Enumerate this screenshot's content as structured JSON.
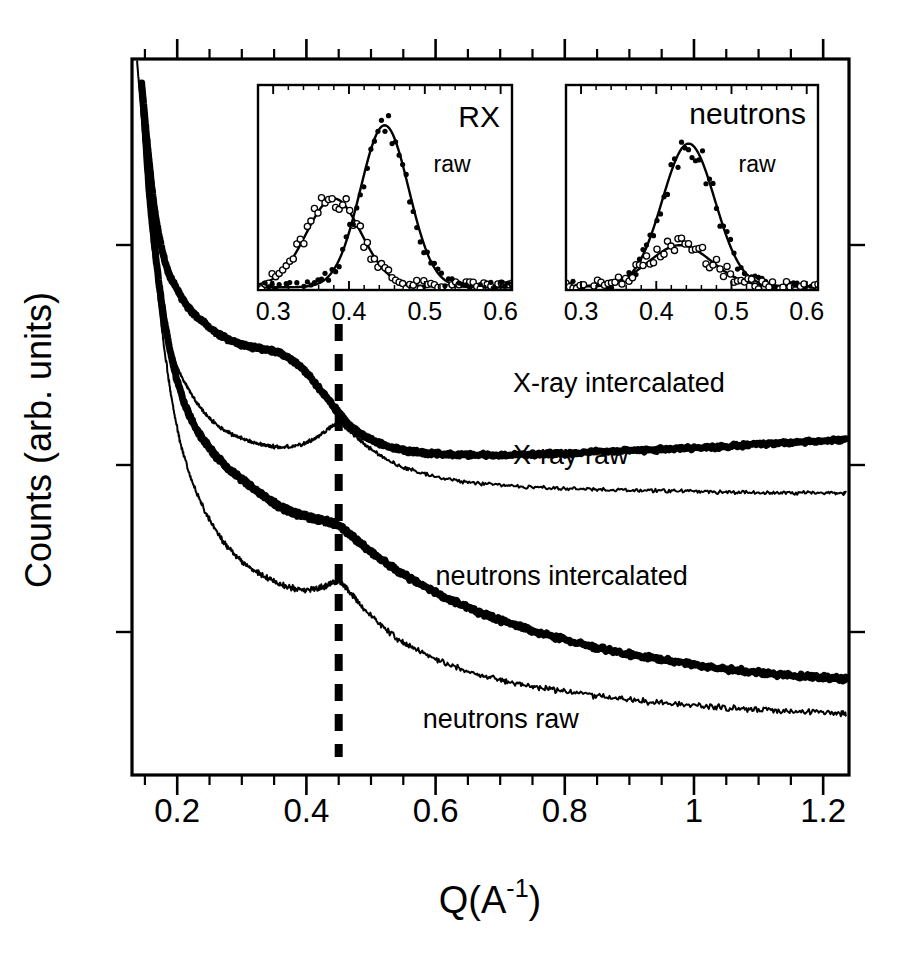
{
  "figure": {
    "caption_present": false,
    "background_color": "#ffffff",
    "ink_color": "#000000"
  },
  "chart_data": {
    "type": "line",
    "title": "",
    "xlabel": "Q(A-1)",
    "xlabel_base": "Q(A",
    "xlabel_sup": "-1",
    "xlabel_tail": ")",
    "ylabel": "Counts (arb. units)",
    "xlim": [
      0.13,
      1.24
    ],
    "ylim": [
      0,
      1
    ],
    "grid": false,
    "legend_position": "inline-annotations",
    "xticks": [
      0.2,
      0.4,
      0.6,
      0.8,
      1.0,
      1.2
    ],
    "xtick_labels": [
      "0.2",
      "0.4",
      "0.6",
      "0.8",
      "1",
      "1.2"
    ],
    "minor_ticks_per_interval": 3,
    "ytick_count": 3,
    "ytick_labels": [],
    "annotations": [
      {
        "name": "dashed-marker",
        "type": "vline",
        "x": 0.45,
        "style": "dashed",
        "linewidth": 7
      }
    ],
    "series": [
      {
        "name": "X-ray intercalated",
        "label": "X-ray intercalated",
        "style": "thick-solid",
        "linewidth": 7,
        "x": [
          0.145,
          0.155,
          0.165,
          0.175,
          0.185,
          0.195,
          0.21,
          0.225,
          0.24,
          0.26,
          0.28,
          0.3,
          0.32,
          0.34,
          0.36,
          0.38,
          0.4,
          0.42,
          0.44,
          0.45,
          0.47,
          0.49,
          0.52,
          0.55,
          0.58,
          0.62,
          0.66,
          0.7,
          0.75,
          0.8,
          0.85,
          0.9,
          0.95,
          1.0,
          1.05,
          1.1,
          1.15,
          1.2,
          1.235
        ],
        "y": [
          0.965,
          0.87,
          0.79,
          0.74,
          0.706,
          0.686,
          0.662,
          0.645,
          0.633,
          0.618,
          0.608,
          0.601,
          0.597,
          0.594,
          0.589,
          0.578,
          0.562,
          0.54,
          0.517,
          0.506,
          0.486,
          0.473,
          0.461,
          0.454,
          0.45,
          0.448,
          0.447,
          0.447,
          0.448,
          0.449,
          0.451,
          0.453,
          0.455,
          0.457,
          0.459,
          0.462,
          0.464,
          0.467,
          0.469
        ]
      },
      {
        "name": "X-ray raw",
        "label": "X-ray raw",
        "style": "thin-solid",
        "linewidth": 2,
        "x": [
          0.138,
          0.145,
          0.152,
          0.16,
          0.17,
          0.18,
          0.192,
          0.205,
          0.22,
          0.24,
          0.26,
          0.28,
          0.3,
          0.32,
          0.34,
          0.36,
          0.38,
          0.4,
          0.42,
          0.44,
          0.45,
          0.46,
          0.48,
          0.5,
          0.53,
          0.56,
          0.6,
          0.65,
          0.7,
          0.75,
          0.8,
          0.85,
          0.9,
          0.95,
          1.0,
          1.05,
          1.1,
          1.15,
          1.2,
          1.235
        ],
        "y": [
          0.995,
          0.92,
          0.84,
          0.76,
          0.69,
          0.636,
          0.592,
          0.56,
          0.535,
          0.508,
          0.49,
          0.478,
          0.47,
          0.464,
          0.46,
          0.458,
          0.459,
          0.464,
          0.474,
          0.487,
          0.492,
          0.486,
          0.47,
          0.455,
          0.438,
          0.427,
          0.417,
          0.409,
          0.405,
          0.402,
          0.4,
          0.399,
          0.398,
          0.397,
          0.396,
          0.395,
          0.394,
          0.394,
          0.394,
          0.394
        ]
      },
      {
        "name": "neutrons intercalated",
        "label": "neutrons intercalated",
        "style": "thick-solid",
        "linewidth": 7,
        "x": [
          0.148,
          0.158,
          0.17,
          0.182,
          0.196,
          0.212,
          0.228,
          0.245,
          0.262,
          0.28,
          0.3,
          0.32,
          0.34,
          0.355,
          0.37,
          0.385,
          0.4,
          0.415,
          0.43,
          0.44,
          0.45,
          0.465,
          0.48,
          0.5,
          0.53,
          0.56,
          0.6,
          0.64,
          0.68,
          0.72,
          0.76,
          0.8,
          0.85,
          0.9,
          0.95,
          1.0,
          1.05,
          1.1,
          1.15,
          1.2,
          1.235
        ],
        "y": [
          0.93,
          0.8,
          0.7,
          0.625,
          0.565,
          0.518,
          0.486,
          0.463,
          0.444,
          0.428,
          0.413,
          0.399,
          0.386,
          0.377,
          0.37,
          0.365,
          0.361,
          0.358,
          0.355,
          0.352,
          0.348,
          0.338,
          0.327,
          0.312,
          0.292,
          0.275,
          0.255,
          0.238,
          0.223,
          0.21,
          0.199,
          0.189,
          0.178,
          0.169,
          0.161,
          0.154,
          0.148,
          0.143,
          0.139,
          0.136,
          0.134
        ]
      },
      {
        "name": "neutrons raw",
        "label": "neutrons raw",
        "style": "thin-solid",
        "linewidth": 2,
        "x": [
          0.152,
          0.162,
          0.174,
          0.188,
          0.203,
          0.22,
          0.238,
          0.256,
          0.275,
          0.295,
          0.315,
          0.335,
          0.355,
          0.375,
          0.395,
          0.415,
          0.43,
          0.44,
          0.45,
          0.465,
          0.48,
          0.5,
          0.53,
          0.56,
          0.6,
          0.64,
          0.68,
          0.72,
          0.76,
          0.8,
          0.85,
          0.9,
          0.95,
          1.0,
          1.05,
          1.1,
          1.15,
          1.2,
          1.235
        ],
        "y": [
          0.915,
          0.76,
          0.64,
          0.545,
          0.472,
          0.418,
          0.378,
          0.347,
          0.322,
          0.303,
          0.288,
          0.277,
          0.268,
          0.262,
          0.259,
          0.26,
          0.264,
          0.268,
          0.27,
          0.258,
          0.242,
          0.222,
          0.198,
          0.18,
          0.162,
          0.148,
          0.137,
          0.129,
          0.122,
          0.117,
          0.11,
          0.105,
          0.101,
          0.097,
          0.094,
          0.091,
          0.089,
          0.087,
          0.086
        ]
      }
    ],
    "curve_labels": [
      {
        "name": "x-ray-intercalated-label",
        "text": "X-ray intercalated",
        "x": 0.72,
        "y": 0.545
      },
      {
        "name": "x-ray-raw-label",
        "text": "X-ray raw",
        "x": 0.72,
        "y": 0.445
      },
      {
        "name": "neutrons-intercalated-label",
        "text": "neutrons intercalated",
        "x": 0.6,
        "y": 0.275
      },
      {
        "name": "neutrons-raw-label",
        "text": "neutrons raw",
        "x": 0.58,
        "y": 0.075
      }
    ],
    "insets": [
      {
        "name": "rx-inset",
        "title": "RX",
        "subtitle": "raw",
        "type": "scatter+line",
        "xlim": [
          0.28,
          0.615
        ],
        "ylim": [
          0,
          1.12
        ],
        "xticks": [
          0.3,
          0.4,
          0.5,
          0.6
        ],
        "xtick_labels": [
          "0.3",
          "0.4",
          "0.5",
          "0.6"
        ],
        "minor_ticks_per_interval": 4,
        "series": [
          {
            "name": "open-circles",
            "marker": "open-circle",
            "peak_x": 0.38,
            "peak_y": 0.5,
            "fwhm": 0.085,
            "baseline": 0.02
          },
          {
            "name": "filled-circles",
            "marker": "filled-circle",
            "peak_x": 0.447,
            "peak_y": 0.9,
            "fwhm": 0.075,
            "baseline": 0.015
          }
        ]
      },
      {
        "name": "neutrons-inset",
        "title": "neutrons",
        "subtitle": "raw",
        "type": "scatter+line",
        "xlim": [
          0.28,
          0.615
        ],
        "ylim": [
          0,
          1.12
        ],
        "xticks": [
          0.3,
          0.4,
          0.5,
          0.6
        ],
        "xtick_labels": [
          "0.3",
          "0.4",
          "0.5",
          "0.6"
        ],
        "minor_ticks_per_interval": 4,
        "series": [
          {
            "name": "filled-circles",
            "marker": "filled-circle",
            "peak_x": 0.443,
            "peak_y": 0.8,
            "fwhm": 0.082,
            "baseline": 0.02
          },
          {
            "name": "open-circles",
            "marker": "open-circle",
            "peak_x": 0.432,
            "peak_y": 0.245,
            "fwhm": 0.098,
            "baseline": 0.02
          }
        ]
      }
    ]
  }
}
